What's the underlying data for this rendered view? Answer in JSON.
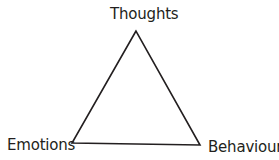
{
  "diagram": {
    "type": "triangle",
    "stroke_color": "#231f20",
    "background": "#ffffff",
    "vertices": {
      "top": {
        "label": "Thoughts"
      },
      "bottom_left": {
        "label": "Emotions"
      },
      "bottom_right": {
        "label": "Behaviours"
      }
    }
  }
}
